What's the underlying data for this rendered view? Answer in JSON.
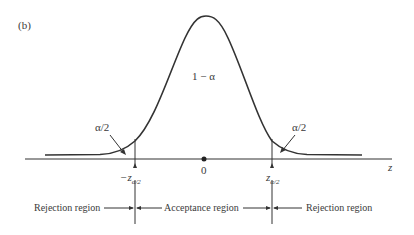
{
  "figure": {
    "panel_label": "(b)",
    "center_area_label": "1 − α",
    "left_tail_label": "α/2",
    "right_tail_label": "α/2",
    "axis_variable": "z",
    "origin_label": "0",
    "left_critical": {
      "prefix": "−z",
      "sub": "α/2"
    },
    "right_critical": {
      "prefix": "z",
      "sub": "α/2"
    },
    "regions": {
      "left": "Rejection region",
      "middle": "Acceptance region",
      "right": "Rejection region"
    },
    "colors": {
      "ink": "#333333",
      "background": "#ffffff"
    }
  }
}
